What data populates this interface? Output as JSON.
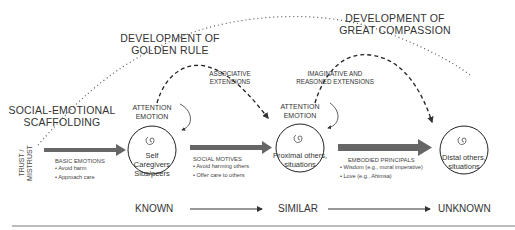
{
  "headers": {
    "golden_rule": [
      "DEVELOPMENT OF",
      "GOLDEN RULE"
    ],
    "great_compassion": [
      "DEVELOPMENT OF",
      "GREAT COMPASSION"
    ],
    "scaffolding": [
      "SOCIAL-EMOTIONAL",
      "SCAFFOLDING"
    ]
  },
  "extensions": {
    "associative": [
      "ASSOCIATIVE",
      "EXTENSIONS"
    ],
    "imaginative": [
      "IMAGINATIVE AND",
      "REASONED EXTENSIONS"
    ]
  },
  "attention_labels": [
    [
      "ATTENTION",
      "EMOTION"
    ],
    [
      "ATTENTION",
      "EMOTION"
    ],
    [
      "ATTENTION",
      "EMOTION"
    ]
  ],
  "circles": [
    {
      "lines": [
        "Self",
        "Caregivers",
        "Sibs/peers"
      ]
    },
    {
      "lines": [
        "Proximal others,",
        "situations"
      ]
    },
    {
      "lines": [
        "Distal others,",
        "situations"
      ]
    }
  ],
  "trust": [
    "TRUST /",
    "MISTRUST"
  ],
  "stages": [
    {
      "title": "BASIC EMOTIONS",
      "bullets": [
        "• Avoid harm",
        "• Approach care"
      ]
    },
    {
      "title": "SOCIAL MOTIVES",
      "bullets": [
        "• Avoid harming others",
        "• Offer care to others"
      ]
    },
    {
      "title": "EMBODIED PRINCIPALS",
      "bullets": [
        "• Wisdom (e.g., moral imperative)",
        "• Love (e.g., Ahimsa)"
      ]
    }
  ],
  "axis": [
    "KNOWN",
    "SIMILAR",
    "UNKNOWN"
  ],
  "colors": {
    "line": "#333333",
    "arrow": "#555555",
    "text": "#2a2a2a"
  }
}
